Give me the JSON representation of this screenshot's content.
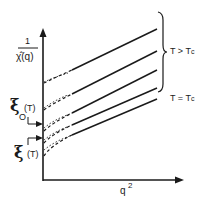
{
  "figure": {
    "y_axis": {
      "label_numerator": "1",
      "label_denominator": "χ̂(q)"
    },
    "x_axis": {
      "label_base": "q",
      "label_exp": "2"
    },
    "annotations": {
      "xi_upper_symbol": "ξ",
      "xi_upper_arg": "(T)",
      "xi_upper_sub": "O",
      "xi_lower_symbol": "ξ",
      "xi_lower_arg": "(T)"
    },
    "legend": {
      "brace_label": "T > T",
      "brace_label_sub": "c",
      "tc_label": "T = T",
      "tc_label_sub": "c"
    },
    "curves": [
      {
        "name": "curve-1",
        "group": "T > Tc",
        "intercept_y": 82,
        "end_y": 29
      },
      {
        "name": "curve-2",
        "group": "T > Tc",
        "intercept_y": 108,
        "end_y": 51
      },
      {
        "name": "curve-3",
        "group": "T > Tc",
        "intercept_y": 128,
        "end_y": 70
      },
      {
        "name": "curve-4",
        "group": "T > Tc",
        "intercept_y": 140,
        "end_y": 88
      },
      {
        "name": "curve-5",
        "group": "T = Tc",
        "intercept_y": 150,
        "end_y": 99
      }
    ],
    "colors": {
      "ink": "#1a1a1a",
      "background": "#ffffff"
    }
  }
}
